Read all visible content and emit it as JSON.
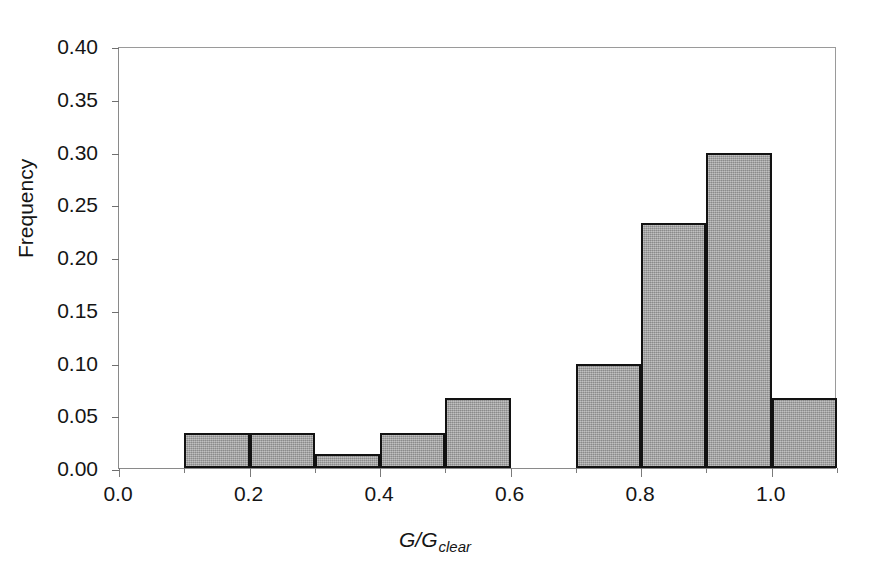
{
  "chart_data": {
    "type": "bar",
    "title": "",
    "subtitle": "",
    "xlabel": "G/G_clear",
    "xlabel_base": "G/G",
    "xlabel_sub": "clear",
    "ylabel": "Frequency",
    "xlim": [
      0.0,
      1.1
    ],
    "ylim": [
      0.0,
      0.4
    ],
    "grid": false,
    "legend": "none",
    "bin_width": 0.1,
    "x_ticks": [
      0.0,
      0.2,
      0.4,
      0.6,
      0.8,
      1.0
    ],
    "x_tick_labels": [
      "0.0",
      "0.2",
      "0.4",
      "0.6",
      "0.8",
      "1.0"
    ],
    "x_minor_ticks": [
      0.1,
      0.3,
      0.5,
      0.7,
      0.9,
      1.1
    ],
    "y_ticks": [
      0.0,
      0.05,
      0.1,
      0.15,
      0.2,
      0.25,
      0.3,
      0.35,
      0.4
    ],
    "y_tick_labels": [
      "0.00",
      "0.05",
      "0.10",
      "0.15",
      "0.20",
      "0.25",
      "0.30",
      "0.35",
      "0.40"
    ],
    "bin_edges": [
      0.1,
      0.2,
      0.3,
      0.4,
      0.5,
      0.6,
      0.7,
      0.8,
      0.9,
      1.0,
      1.1
    ],
    "categories": [
      "0.1-0.2",
      "0.2-0.3",
      "0.3-0.4",
      "0.4-0.5",
      "0.5-0.6",
      "0.6-0.7",
      "0.7-0.8",
      "0.8-0.9",
      "0.9-1.0",
      "1.0-1.1"
    ],
    "values": [
      0.033,
      0.033,
      0.013,
      0.033,
      0.066,
      0.0,
      0.099,
      0.232,
      0.299,
      0.066
    ],
    "bars": [
      {
        "x0": 0.1,
        "x1": 0.2,
        "value": 0.033
      },
      {
        "x0": 0.2,
        "x1": 0.3,
        "value": 0.033
      },
      {
        "x0": 0.3,
        "x1": 0.4,
        "value": 0.013
      },
      {
        "x0": 0.4,
        "x1": 0.5,
        "value": 0.033
      },
      {
        "x0": 0.5,
        "x1": 0.6,
        "value": 0.066
      },
      {
        "x0": 0.6,
        "x1": 0.7,
        "value": 0.0
      },
      {
        "x0": 0.7,
        "x1": 0.8,
        "value": 0.099
      },
      {
        "x0": 0.8,
        "x1": 0.9,
        "value": 0.232
      },
      {
        "x0": 0.9,
        "x1": 1.0,
        "value": 0.299
      },
      {
        "x0": 1.0,
        "x1": 1.1,
        "value": 0.066
      }
    ],
    "colors": {
      "bar_fill": "#a9a9a9",
      "bar_edge": "#121212",
      "axis": "#8a8a8a",
      "text": "#151515",
      "background": "#ffffff"
    }
  }
}
